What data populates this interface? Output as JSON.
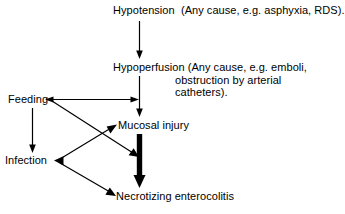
{
  "diagram": {
    "background_color": "#ffffff",
    "line_color": "#000000",
    "nodes": {
      "hypotension": {
        "id": "hypotension",
        "text": "Hypotension  (Any cause, e.g. asphyxia, RDS)."
      },
      "hypoperfusion": {
        "id": "hypoperfusion",
        "line1": "Hypoperfusion (Any cause, e.g. emboli,",
        "line2": "obstruction by arterial",
        "line3": "catheters)."
      },
      "mucosal_injury": {
        "id": "mucosal-injury",
        "text": "Mucosal injury"
      },
      "feeding": {
        "id": "feeding",
        "text": "Feeding"
      },
      "infection": {
        "id": "infection",
        "text": "Infection"
      },
      "necrotizing_enterocolitis": {
        "id": "necrotizing-enterocolitis",
        "text": "Necrotizing enterocolitis"
      }
    },
    "edges": [
      {
        "id": "hypotension-to-hypoperfusion",
        "from": "hypotension",
        "to": "hypoperfusion",
        "style": "thin",
        "direction": "down",
        "heads": "end"
      },
      {
        "id": "hypoperfusion-to-mucosal-injury",
        "from": "hypoperfusion",
        "to": "mucosal_injury",
        "style": "thin",
        "direction": "down",
        "heads": "end"
      },
      {
        "id": "feeding-to-hypoperfusion-stem",
        "from": "feeding",
        "to": "hypoperfusion",
        "style": "thin",
        "direction": "horizontal",
        "heads": "both"
      },
      {
        "id": "feeding-to-infection",
        "from": "feeding",
        "to": "infection",
        "style": "thin",
        "direction": "down",
        "heads": "end"
      },
      {
        "id": "feeding-to-thick-arrow",
        "from": "feeding",
        "to": "necrotizing_enterocolitis",
        "style": "thin",
        "direction": "diagonal-down-right",
        "heads": "end"
      },
      {
        "id": "infection-to-mucosal-injury",
        "from": "infection",
        "to": "mucosal_injury",
        "style": "thin",
        "direction": "diagonal-up-right",
        "heads": "end"
      },
      {
        "id": "infection-to-necrotizing-enterocolitis",
        "from": "infection",
        "to": "necrotizing_enterocolitis",
        "style": "thin",
        "direction": "diagonal-down-right",
        "heads": "end"
      },
      {
        "id": "mucosal-injury-to-necrotizing-enterocolitis",
        "from": "mucosal_injury",
        "to": "necrotizing_enterocolitis",
        "style": "thick",
        "direction": "down",
        "heads": "end"
      }
    ]
  }
}
